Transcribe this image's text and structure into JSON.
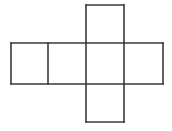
{
  "figure": {
    "name": "cube-net-diagram",
    "shape_label": "cube net",
    "face_count": 6,
    "background_color": "#ffffff",
    "line_color": "#3a3a3a",
    "line_width": 1.6,
    "canvas": {
      "width": 172,
      "height": 131
    },
    "square_size": 38,
    "faces": [
      {
        "id": "face-top",
        "x": 86,
        "y": 5,
        "w": 38,
        "h": 38
      },
      {
        "id": "face-left",
        "x": 11,
        "y": 43,
        "w": 37,
        "h": 41
      },
      {
        "id": "face-front",
        "x": 48,
        "y": 43,
        "w": 38,
        "h": 41
      },
      {
        "id": "face-right",
        "x": 86,
        "y": 43,
        "w": 38,
        "h": 41
      },
      {
        "id": "face-back",
        "x": 124,
        "y": 43,
        "w": 39,
        "h": 41
      },
      {
        "id": "face-bottom",
        "x": 86,
        "y": 84,
        "w": 38,
        "h": 38
      }
    ],
    "edges": [
      {
        "id": "edge-top-square-top",
        "x1": 86,
        "y1": 5,
        "x2": 124,
        "y2": 5
      },
      {
        "id": "edge-top-square-left",
        "x1": 86,
        "y1": 5,
        "x2": 86,
        "y2": 43
      },
      {
        "id": "edge-top-square-right",
        "x1": 124,
        "y1": 5,
        "x2": 124,
        "y2": 43
      },
      {
        "id": "edge-band-top",
        "x1": 11,
        "y1": 43,
        "x2": 163,
        "y2": 43
      },
      {
        "id": "edge-band-bottom",
        "x1": 11,
        "y1": 84,
        "x2": 163,
        "y2": 84
      },
      {
        "id": "edge-band-left",
        "x1": 11,
        "y1": 43,
        "x2": 11,
        "y2": 84
      },
      {
        "id": "edge-band-right",
        "x1": 163,
        "y1": 43,
        "x2": 163,
        "y2": 84
      },
      {
        "id": "edge-divider-1",
        "x1": 48,
        "y1": 43,
        "x2": 48,
        "y2": 84
      },
      {
        "id": "edge-divider-2",
        "x1": 86,
        "y1": 43,
        "x2": 86,
        "y2": 84
      },
      {
        "id": "edge-divider-3",
        "x1": 124,
        "y1": 43,
        "x2": 124,
        "y2": 84
      },
      {
        "id": "edge-bottom-square-left",
        "x1": 86,
        "y1": 84,
        "x2": 86,
        "y2": 122
      },
      {
        "id": "edge-bottom-square-right",
        "x1": 124,
        "y1": 84,
        "x2": 124,
        "y2": 122
      },
      {
        "id": "edge-bottom-square-bottom",
        "x1": 86,
        "y1": 122,
        "x2": 124,
        "y2": 122
      }
    ]
  }
}
